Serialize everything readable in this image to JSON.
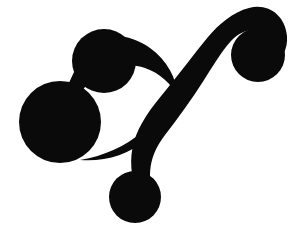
{
  "artwork": {
    "title": "Ornamental Swirl Flourish",
    "type": "vector-silhouette",
    "canvas": {
      "width": 293,
      "height": 234,
      "background_color": "#ffffff"
    },
    "ink_color": "#0a0a0a",
    "description": "Solid black calligraphic flourish: a sweeping S-curve arc ending in a spiral curl at upper right, with three filled circular terminals (upper-left medium disc, left large disc, lower-center small disc).",
    "elements": [
      {
        "name": "spiral-curl-terminal",
        "shape": "circle",
        "position": "upper-right",
        "cx": 258,
        "cy": 55,
        "r": 27,
        "color": "#0a0a0a"
      },
      {
        "name": "upper-left-dot-terminal",
        "shape": "circle",
        "position": "upper-left",
        "cx": 104,
        "cy": 61,
        "r": 32,
        "color": "#0a0a0a"
      },
      {
        "name": "large-dot-terminal",
        "shape": "circle",
        "position": "left",
        "cx": 60,
        "cy": 122,
        "r": 41,
        "color": "#0a0a0a"
      },
      {
        "name": "lower-dot-terminal",
        "shape": "circle",
        "position": "bottom-center",
        "cx": 135,
        "cy": 197,
        "r": 26,
        "color": "#0a0a0a"
      },
      {
        "name": "main-arc-stroke",
        "shape": "tapered-curve",
        "from": "lower-dot-terminal",
        "to": "spiral-curl-terminal"
      },
      {
        "name": "secondary-sweep-stroke",
        "shape": "tapered-curve",
        "from": "upper-left-dot-terminal",
        "to": "large-dot-terminal"
      }
    ]
  }
}
